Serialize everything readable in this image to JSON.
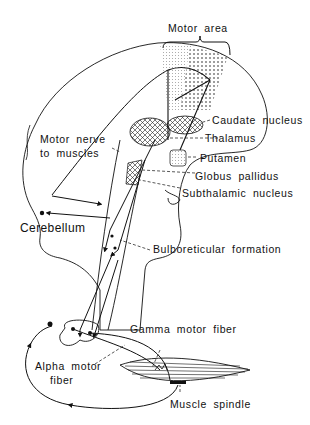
{
  "diagram": {
    "type": "anatomical-pathway",
    "labels": {
      "motor_area": "Motor area",
      "caudate_nucleus": "Caudate nucleus",
      "thalamus": "Thalamus",
      "motor_nerve_line1": "Motor nerve",
      "motor_nerve_line2": "to muscles",
      "putamen": "Putamen",
      "globus_pallidus": "Globus pallidus",
      "subthalamic_nucleus": "Subthalamic nucleus",
      "cerebellum": "Cerebellum",
      "bulboreticular_formation": "Bulboreticular formation",
      "gamma_motor_fiber": "Gamma motor fiber",
      "alpha_motor_line1": "Alpha motor",
      "alpha_motor_line2": "fiber",
      "muscle_spindle": "Muscle spindle"
    },
    "colors": {
      "ink": "#111111",
      "background": "#ffffff"
    }
  }
}
